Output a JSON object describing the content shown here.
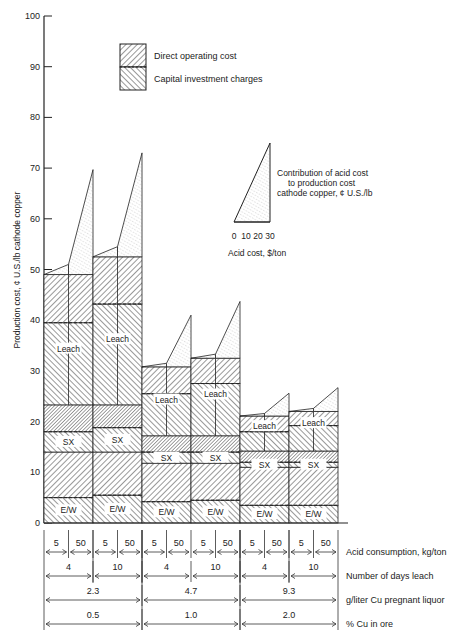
{
  "chart_data": {
    "type": "bar",
    "subtype": "stacked-bar-with-acid-triangles",
    "ylabel": "Production cost, ¢ U.S./lb cathode copper",
    "ylim": [
      0,
      100
    ],
    "yticks": [
      0,
      10,
      20,
      30,
      40,
      50,
      60,
      70,
      80,
      90,
      100
    ],
    "legend": {
      "items": [
        {
          "label": "Direct operating cost",
          "pattern": "backslash-hatch"
        },
        {
          "label": "Capital investment charges",
          "pattern": "slash-hatch"
        }
      ],
      "position": "top-center"
    },
    "triangle_legend": {
      "label_lines": [
        "Contribution of acid cost",
        "to production cost",
        "cathode copper, ¢ U.S./lb"
      ],
      "axis_ticks": [
        "0",
        "10",
        "20",
        "30"
      ],
      "axis_label": "Acid cost, $/ton"
    },
    "segment_labels": {
      "leach": "Leach",
      "sx": "SX",
      "ew": "E/W"
    },
    "x_rows": [
      {
        "label": "Acid consumption, kg/ton",
        "values": [
          "5",
          "50",
          "5",
          "50",
          "5",
          "50",
          "5",
          "50",
          "5",
          "50",
          "5",
          "50"
        ]
      },
      {
        "label": "Number of days leach",
        "values": [
          "4",
          "10",
          "4",
          "10",
          "4",
          "10"
        ]
      },
      {
        "label": "g/liter Cu pregnant liquor",
        "values": [
          "2.3",
          "4.7",
          "9.3"
        ]
      },
      {
        "label": "% Cu in ore",
        "values": [
          "0.5",
          "1.0",
          "2.0"
        ]
      }
    ],
    "bars": [
      {
        "cu_pct": "0.5",
        "days": "4",
        "ew_capital": 5.0,
        "ew_operating": 14.0,
        "sx_capital": 18.0,
        "sx_operating": 23.3,
        "leach_capital": 39.5,
        "leach_operating": 49.0,
        "acid_5_total": 49.0,
        "acid_50_base": 51.0,
        "acid_50_peak": 69.7
      },
      {
        "cu_pct": "0.5",
        "days": "10",
        "ew_capital": 5.5,
        "ew_operating": 14.0,
        "sx_capital": 18.8,
        "sx_operating": 23.3,
        "leach_capital": 43.2,
        "leach_operating": 52.5,
        "acid_5_total": 52.5,
        "acid_50_base": 54.5,
        "acid_50_peak": 73.0
      },
      {
        "cu_pct": "1.0",
        "days": "4",
        "ew_capital": 4.2,
        "ew_operating": 11.8,
        "sx_capital": 14.0,
        "sx_operating": 17.2,
        "leach_capital": 25.5,
        "leach_operating": 30.8,
        "acid_5_total": 30.8,
        "acid_50_base": 31.5,
        "acid_50_peak": 41.0
      },
      {
        "cu_pct": "1.0",
        "days": "10",
        "ew_capital": 4.5,
        "ew_operating": 11.8,
        "sx_capital": 14.0,
        "sx_operating": 17.2,
        "leach_capital": 27.5,
        "leach_operating": 32.5,
        "acid_5_total": 32.5,
        "acid_50_base": 33.3,
        "acid_50_peak": 43.7
      },
      {
        "cu_pct": "2.0",
        "days": "4",
        "ew_capital": 3.5,
        "ew_operating": 11.0,
        "sx_capital": 12.0,
        "sx_operating": 14.2,
        "leach_capital": 18.0,
        "leach_operating": 21.1,
        "acid_5_total": 21.1,
        "acid_50_base": 21.6,
        "acid_50_peak": 25.6
      },
      {
        "cu_pct": "2.0",
        "days": "10",
        "ew_capital": 3.5,
        "ew_operating": 11.0,
        "sx_capital": 12.0,
        "sx_operating": 14.2,
        "leach_capital": 19.2,
        "leach_operating": 22.0,
        "acid_5_total": 22.0,
        "acid_50_base": 22.6,
        "acid_50_peak": 26.7
      }
    ]
  }
}
